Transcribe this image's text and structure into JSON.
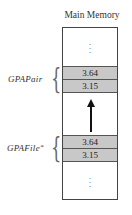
{
  "diagram": {
    "title": "Main Memory",
    "top_ellipsis": "⋮",
    "bottom_ellipsis": "⋮",
    "blocks": [
      {
        "label": "GPAPair",
        "label_marker": "",
        "cells": [
          "3.64",
          "3.15"
        ]
      },
      {
        "label": "GPAFile",
        "label_marker": "*",
        "cells": [
          "3.64",
          "3.15"
        ]
      }
    ],
    "arrow": {
      "from": "GPAFile",
      "to": "GPAPair",
      "direction": "up"
    }
  }
}
